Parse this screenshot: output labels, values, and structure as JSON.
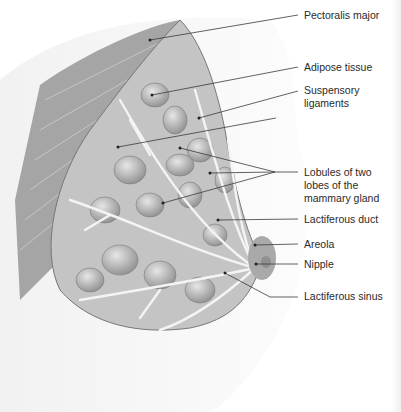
{
  "figure": {
    "labels": [
      {
        "id": "pectoralis-major",
        "text": "Pectoralis major",
        "top": 9
      },
      {
        "id": "adipose-tissue",
        "text": "Adipose tissue",
        "top": 61
      },
      {
        "id": "suspensory-ligaments",
        "lines": [
          "Suspensory",
          "ligaments"
        ],
        "top": 84
      },
      {
        "id": "lobules",
        "lines": [
          "Lobules of two",
          "lobes of the",
          "mammary gland"
        ],
        "top": 166
      },
      {
        "id": "lactiferous-duct",
        "text": "Lactiferous duct",
        "top": 213
      },
      {
        "id": "areola",
        "text": "Areola",
        "top": 238
      },
      {
        "id": "nipple",
        "text": "Nipple",
        "top": 258
      },
      {
        "id": "lactiferous-sinus",
        "text": "Lactiferous sinus",
        "top": 290
      }
    ],
    "colors": {
      "line": "#3a3a3a",
      "text": "#2a2a2a",
      "tissue": "#b9b9b9",
      "muscle": "#9a9a9a",
      "duct": "#f2f2f2"
    }
  }
}
